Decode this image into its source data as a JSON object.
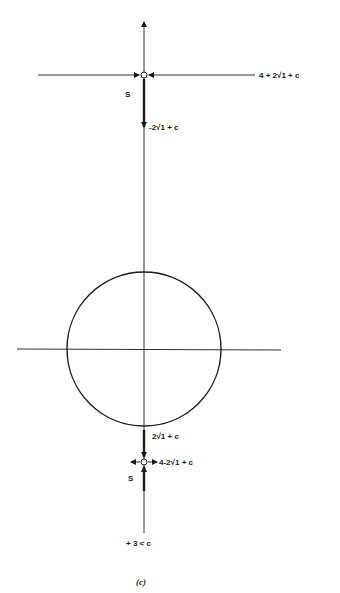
{
  "figure": {
    "caption": "(c)",
    "upper_point": {
      "right_label": "4 + 2√1 + c",
      "below_label": "-2√1 + c",
      "side_label": "S"
    },
    "lower_point": {
      "above_label": "2√1 + c",
      "right_label": "4-2√1 + c",
      "side_label": "S"
    },
    "bottom_label": "+ 3 < c",
    "colors": {
      "ink": "#1a1a1a",
      "background": "#ffffff"
    }
  }
}
